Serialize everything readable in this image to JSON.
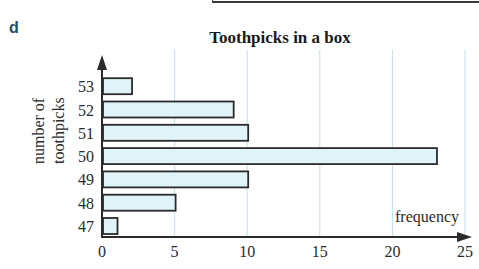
{
  "part_label": "d",
  "chart_data": {
    "type": "bar",
    "orientation": "horizontal",
    "title": "Toothpicks in a box",
    "xlabel": "frequency",
    "ylabel": "number of toothpicks",
    "categories": [
      "47",
      "48",
      "49",
      "50",
      "51",
      "52",
      "53"
    ],
    "values": [
      1,
      5,
      10,
      23,
      10,
      9,
      2
    ],
    "xlim": [
      0,
      25
    ],
    "xticks": [
      "0",
      "5",
      "10",
      "15",
      "20",
      "25"
    ],
    "grid": "vertical lines at 5, 10, 15, 20, 25",
    "bar_color": "#dff3f8",
    "bar_edge_color": "#2b2b2b",
    "grid_color": "#bfe0ea",
    "legend": "none"
  },
  "ylabel_lines": [
    "number of",
    "toothpicks"
  ]
}
